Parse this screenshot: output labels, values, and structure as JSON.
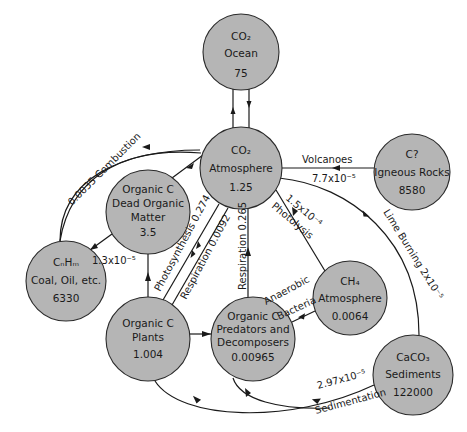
{
  "diagram": {
    "colors": {
      "node_fill": "#b5b5b5",
      "node_stroke": "#2a2a2a",
      "line": "#1a1a1a",
      "background": "#ffffff"
    },
    "nodes": [
      {
        "id": "co2_ocean",
        "lines": [
          "CO₂",
          "Ocean",
          "75"
        ],
        "cx": 241,
        "cy": 52,
        "r": 38
      },
      {
        "id": "co2_atmosphere",
        "lines": [
          "CO₂",
          "Atmosphere",
          "1.25"
        ],
        "cx": 241,
        "cy": 168,
        "r": 41
      },
      {
        "id": "igneous_rocks",
        "lines": [
          "C?",
          "Igneous  Rocks",
          "8580"
        ],
        "cx": 412,
        "cy": 172,
        "r": 38
      },
      {
        "id": "dead_organic",
        "lines": [
          "Organic C",
          "Dead Organic",
          "Matter",
          "3.5"
        ],
        "cx": 148,
        "cy": 212,
        "r": 42
      },
      {
        "id": "fossil_fuels",
        "lines": [
          "CₙHₘ",
          "Coal, Oil, etc.",
          "6330"
        ],
        "cx": 66,
        "cy": 281,
        "r": 40
      },
      {
        "id": "ch4_atmosphere",
        "lines": [
          "CH₄",
          "Atmosphere",
          "0.0064"
        ],
        "cx": 350,
        "cy": 298,
        "r": 37
      },
      {
        "id": "plants",
        "lines": [
          "Organic C",
          "Plants",
          "1.004"
        ],
        "cx": 148,
        "cy": 339,
        "r": 42
      },
      {
        "id": "predators",
        "lines": [
          "Organic C",
          "Predators and",
          "Decomposers",
          "0.00965"
        ],
        "cx": 253,
        "cy": 339,
        "r": 42
      },
      {
        "id": "sediments",
        "lines": [
          "CaCO₃",
          "Sediments",
          "122000"
        ],
        "cx": 413,
        "cy": 375,
        "r": 40
      }
    ],
    "edges": [
      {
        "from": "fossil_fuels",
        "to": "co2_atmosphere",
        "label": "0.0035 Combustion"
      },
      {
        "from": "igneous_rocks",
        "to": "co2_atmosphere",
        "label": "Volcanoes",
        "value": "7.7x10⁻⁵"
      },
      {
        "from": "dead_organic",
        "to": "co2_atmosphere",
        "label": ""
      },
      {
        "from": "dead_organic",
        "to": "fossil_fuels",
        "label": "1.3x10⁻⁵"
      },
      {
        "from": "plants",
        "to": "dead_organic",
        "label": ""
      },
      {
        "from": "co2_atmosphere",
        "to": "plants",
        "label": "Photosynthesis 0.274"
      },
      {
        "from": "plants",
        "to": "co2_atmosphere",
        "label": "Respiration 0.0092"
      },
      {
        "from": "predators",
        "to": "co2_atmosphere",
        "label": "Respiration 0.265"
      },
      {
        "from": "ch4_atmosphere",
        "to": "co2_atmosphere",
        "label": "Photolysis",
        "value": "1.5x10⁻⁴"
      },
      {
        "from": "predators",
        "to": "ch4_atmosphere",
        "label": "Anaerobic Bacteria"
      },
      {
        "from": "plants",
        "to": "predators",
        "label": ""
      },
      {
        "from": "sediments",
        "to": "co2_atmosphere",
        "label": "Lime Burning",
        "value": "2x10⁻⁵"
      },
      {
        "from": "plants",
        "to": "sediments",
        "label": "Sedimentation",
        "value": "2.97x10⁻⁵"
      },
      {
        "from": "predators",
        "to": "sediments",
        "label": ""
      },
      {
        "from": "co2_ocean",
        "to": "co2_atmosphere",
        "label": ""
      },
      {
        "from": "co2_atmosphere",
        "to": "co2_ocean",
        "label": ""
      }
    ],
    "labels": {
      "combustion": "0.0035 Combustion",
      "volcanoes": "Volcanoes",
      "volcanoes_value": "7.7x10⁻⁵",
      "fossil_burial": "1.3x10⁻⁵",
      "photosynthesis": "Photosynthesis 0.274",
      "respiration_plants": "Respiration 0.0092",
      "respiration_decomp": "Respiration 0.265",
      "photolysis_value": "1.5x10⁻⁴",
      "photolysis": "Photolysis",
      "anaerobic": "Anaerobic",
      "bacteria": "Bacteria",
      "lime_burning": "Lime Burning  2x10⁻⁵",
      "sedimentation_value": "2.97x10⁻⁵",
      "sedimentation": "Sedimentation"
    }
  }
}
